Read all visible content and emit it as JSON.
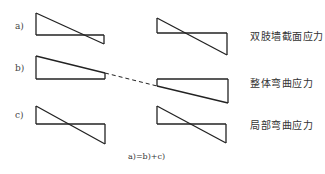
{
  "rows": [
    {
      "id": "a",
      "label": "a)",
      "description": "双肢墙截面应力",
      "shape": "stress-crossing-left-big"
    },
    {
      "id": "b",
      "label": "b)",
      "description": "整体弯曲应力",
      "shape": "stress-trapezoid"
    },
    {
      "id": "c",
      "label": "c)",
      "description": "局部弯曲应力",
      "shape": "stress-crossing-symmetric"
    }
  ],
  "equation": "a)=b)+c)",
  "colors": {
    "line": "#222222",
    "background": "#ffffff"
  }
}
